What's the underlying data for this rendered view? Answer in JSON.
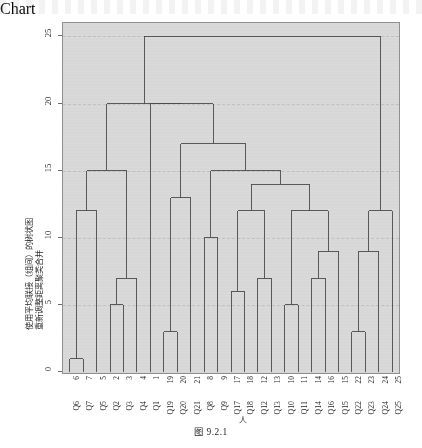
{
  "figure": {
    "caption": "图 9.2.1",
    "y_axis_title_line1": "使用平均联接（组间）的树状图",
    "y_axis_title_line2": "重新调整距离聚类合并",
    "x_axis_note": "人"
  },
  "chart_data": {
    "type": "dendrogram",
    "title": "使用平均联接（组间）的树状图",
    "ylabel": "重新调整距离聚类合并",
    "xlabel": "人",
    "ylim": [
      0,
      26
    ],
    "yticks": [
      0,
      5,
      10,
      15,
      20,
      25
    ],
    "grid": true,
    "grid_style": "dashed",
    "orientation": "vertical",
    "leaf_order": [
      "Q6",
      "Q7",
      "Q5",
      "Q2",
      "Q3",
      "Q4",
      "Q1",
      "Q19",
      "Q20",
      "Q21",
      "Q8",
      "Q9",
      "Q17",
      "Q18",
      "Q12",
      "Q13",
      "Q10",
      "Q11",
      "Q14",
      "Q16",
      "Q15",
      "Q22",
      "Q23",
      "Q24",
      "Q25"
    ],
    "leaf_numbers": [
      "6",
      "7",
      "5",
      "2",
      "3",
      "4",
      "1",
      "19",
      "20",
      "21",
      "8",
      "9",
      "17",
      "18",
      "12",
      "13",
      "10",
      "11",
      "14",
      "16",
      "15",
      "22",
      "23",
      "24",
      "25"
    ],
    "leaf_labels": [
      "Q6",
      "Q7",
      "Q5",
      "Q2",
      "Q3",
      "Q4",
      "Q1",
      "Q19",
      "Q20",
      "Q21",
      "Q8",
      "Q9",
      "Q17",
      "Q18",
      "Q12",
      "Q13",
      "Q10",
      "Q11",
      "Q14",
      "Q16",
      "Q15",
      "Q22",
      "Q23",
      "Q24",
      "Q25"
    ],
    "merges": [
      {
        "id": "m1",
        "left": "Q6",
        "right": "Q7",
        "height": 1
      },
      {
        "id": "m2",
        "left": "Q2",
        "right": "Q3",
        "height": 5
      },
      {
        "id": "m3",
        "left": "m2",
        "right": "Q4",
        "height": 7
      },
      {
        "id": "m4",
        "left": "Q19",
        "right": "Q20",
        "height": 3
      },
      {
        "id": "m5",
        "left": "Q10",
        "right": "Q11",
        "height": 5
      },
      {
        "id": "m6",
        "left": "Q22",
        "right": "Q23",
        "height": 3
      },
      {
        "id": "m7",
        "left": "Q17",
        "right": "Q18",
        "height": 6
      },
      {
        "id": "m8",
        "left": "Q12",
        "right": "Q13",
        "height": 7
      },
      {
        "id": "m9",
        "left": "Q14",
        "right": "Q16",
        "height": 7
      },
      {
        "id": "m10",
        "left": "m1",
        "right": "Q5",
        "height": 12
      },
      {
        "id": "m11",
        "left": "m9",
        "right": "Q15",
        "height": 9
      },
      {
        "id": "m12",
        "left": "m6",
        "right": "Q24",
        "height": 9
      },
      {
        "id": "m13",
        "left": "m4",
        "right": "Q21",
        "height": 13
      },
      {
        "id": "m14",
        "left": "Q8",
        "right": "Q9",
        "height": 10
      },
      {
        "id": "m15",
        "left": "m10",
        "right": "m3",
        "height": 15
      },
      {
        "id": "m16",
        "left": "m7",
        "right": "m8",
        "height": 12
      },
      {
        "id": "m17",
        "left": "m5",
        "right": "m11",
        "height": 12
      },
      {
        "id": "m18",
        "left": "m16",
        "right": "m17",
        "height": 14
      },
      {
        "id": "m19",
        "left": "m14",
        "right": "m18",
        "height": 15
      },
      {
        "id": "m20",
        "left": "m13",
        "right": "m19",
        "height": 17
      },
      {
        "id": "m21",
        "left": "Q1",
        "right": "m20",
        "height": 20
      },
      {
        "id": "m22",
        "left": "m15",
        "right": "m21",
        "height": 20
      },
      {
        "id": "m23",
        "left": "m12",
        "right": "Q25",
        "height": 12
      },
      {
        "id": "m24",
        "left": "m22",
        "right": "m23",
        "height": 25
      }
    ],
    "colors": {
      "plot_background": "#d9d9d9",
      "line": "#4a4a4a",
      "grid": "#bdbdbd",
      "axis": "#6b6b6b",
      "text": "#262626",
      "page": "#ffffff"
    }
  }
}
